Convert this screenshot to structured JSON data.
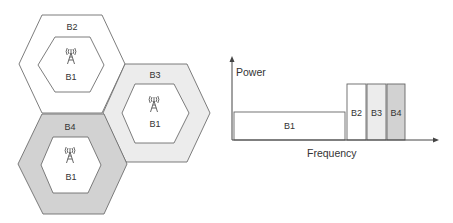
{
  "diagram": {
    "title": "",
    "cells": [
      {
        "id": "top",
        "outer_label": "B2",
        "inner_label": "B1",
        "ring_color": "#ffffff",
        "outer": [
          [
            42,
            15
          ],
          [
            102,
            15
          ],
          [
            125,
            64
          ],
          [
            102,
            113
          ],
          [
            42,
            113
          ],
          [
            19,
            64
          ]
        ],
        "inner": [
          [
            55,
            37
          ],
          [
            90,
            37
          ],
          [
            104,
            65
          ],
          [
            90,
            92
          ],
          [
            55,
            92
          ],
          [
            38,
            65
          ]
        ],
        "outer_label_pos": [
          72,
          30
        ],
        "tower_pos": [
          71,
          56
        ],
        "inner_label_pos": [
          71,
          80
        ]
      },
      {
        "id": "right",
        "outer_label": "B3",
        "inner_label": "B1",
        "ring_color": "#ececec",
        "outer": [
          [
            125,
            64
          ],
          [
            187,
            64
          ],
          [
            210,
            113
          ],
          [
            187,
            162
          ],
          [
            126,
            162
          ],
          [
            103,
            113
          ]
        ],
        "inner": [
          [
            135,
            84
          ],
          [
            174,
            84
          ],
          [
            189,
            113
          ],
          [
            174,
            143
          ],
          [
            135,
            143
          ],
          [
            122,
            113
          ]
        ],
        "outer_label_pos": [
          155,
          78
        ],
        "tower_pos": [
          154,
          104
        ],
        "inner_label_pos": [
          155,
          127
        ]
      },
      {
        "id": "bottom",
        "outer_label": "B4",
        "inner_label": "B1",
        "ring_color": "#d2d2d2",
        "outer": [
          [
            42,
            114
          ],
          [
            104,
            114
          ],
          [
            127,
            164
          ],
          [
            104,
            214
          ],
          [
            43,
            214
          ],
          [
            18,
            164
          ]
        ],
        "inner": [
          [
            53,
            137
          ],
          [
            88,
            137
          ],
          [
            101,
            165
          ],
          [
            88,
            193
          ],
          [
            53,
            193
          ],
          [
            41,
            165
          ]
        ],
        "outer_label_pos": [
          70,
          130
        ],
        "tower_pos": [
          70,
          155
        ],
        "inner_label_pos": [
          71,
          180
        ]
      }
    ],
    "icons": {
      "tower": "cell-tower-icon"
    }
  },
  "chart_data": {
    "type": "bar",
    "title": "",
    "xlabel": "Frequency",
    "ylabel": "Power",
    "grid": false,
    "legend": null,
    "categories": [
      "B1",
      "B2",
      "B3",
      "B4"
    ],
    "values": [
      1,
      2,
      2,
      2
    ],
    "relative_widths": [
      5.8,
      1,
      1,
      1
    ],
    "colors": [
      "#ffffff",
      "#ffffff",
      "#ececec",
      "#d2d2d2"
    ]
  },
  "chart_layout": {
    "origin": [
      232,
      140
    ],
    "x_end": 439,
    "y_top": 56,
    "unit_height": 28,
    "bars": [
      {
        "label": "B1",
        "x": 234,
        "w": 111
      },
      {
        "label": "B2",
        "x": 347,
        "w": 19
      },
      {
        "label": "B3",
        "x": 367,
        "w": 19
      },
      {
        "label": "B4",
        "x": 387,
        "w": 18
      }
    ],
    "ylabel_pos": [
      236,
      76
    ],
    "xlabel_pos": [
      307,
      157
    ]
  }
}
